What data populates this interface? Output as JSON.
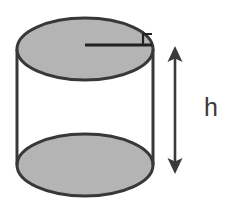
{
  "figure": {
    "shape_name": "cylinder",
    "background_color": "#ffffff",
    "fill_color": "#b4b4b4",
    "stroke_color": "#383838",
    "arrow_color": "#3a3a3a",
    "label_color": "#3a3a3a",
    "stroke_width": 3,
    "labels": {
      "height": "h"
    },
    "annotations": {
      "radius_segment": "radius-line",
      "right_angle_marker": "right-angle-marker",
      "height_arrow": "double-headed-vertical-arrow"
    },
    "geometry": {
      "top_ellipse": {
        "cx": 85,
        "cy": 49,
        "rx": 68,
        "ry": 31
      },
      "bottom_ellipse": {
        "cx": 85,
        "cy": 165,
        "rx": 68,
        "ry": 31
      },
      "left_edge": {
        "x": 17,
        "y1": 49,
        "y2": 165
      },
      "right_edge": {
        "x": 153,
        "y1": 49,
        "y2": 165
      },
      "radius_line": {
        "x1": 85,
        "y1": 45,
        "x2": 152,
        "y2": 45
      },
      "height_arrow": {
        "x": 175,
        "y1": 48,
        "y2": 172
      }
    }
  }
}
